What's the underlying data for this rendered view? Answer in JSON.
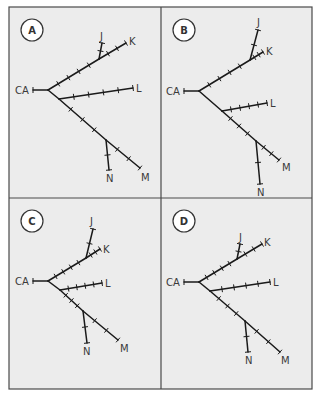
{
  "figure": {
    "outer": {
      "x": 9,
      "y": 7,
      "width": 303,
      "height": 382
    },
    "divider": {
      "x": 161,
      "y": 198
    },
    "colors": {
      "panel_bg": "#ececec",
      "frame": "#4a4a4a",
      "line": "#1a1a1a",
      "label": "#3a3a3a"
    }
  },
  "panels": [
    {
      "label": "A",
      "origin": [
        9,
        7
      ],
      "badge": [
        23,
        23
      ],
      "nodes": {
        "CA": [
          24,
          83
        ],
        "root": [
          39,
          83
        ],
        "jk": [
          90,
          52
        ],
        "J": [
          93,
          36
        ],
        "K": [
          117,
          36
        ],
        "lb": [
          50,
          92
        ],
        "L": [
          124,
          81
        ],
        "mn": [
          97,
          133
        ],
        "N": [
          100,
          163
        ],
        "M": [
          131,
          161
        ]
      },
      "tip_labels": [
        {
          "text": "CA",
          "x": 6,
          "y": 87
        },
        {
          "text": "J",
          "x": 91,
          "y": 33
        },
        {
          "text": "K",
          "x": 120,
          "y": 38
        },
        {
          "text": "L",
          "x": 127,
          "y": 85
        },
        {
          "text": "N",
          "x": 97,
          "y": 175
        },
        {
          "text": "M",
          "x": 132,
          "y": 174
        }
      ]
    },
    {
      "label": "B",
      "origin": [
        161,
        7
      ],
      "badge": [
        23,
        23
      ],
      "nodes": {
        "CA": [
          23,
          84
        ],
        "root": [
          38,
          84
        ],
        "jk": [
          89,
          53
        ],
        "J": [
          97,
          23
        ],
        "K": [
          102,
          45
        ],
        "lb": [
          61,
          104
        ],
        "L": [
          106,
          96
        ],
        "mn": [
          95,
          134
        ],
        "N": [
          99,
          177
        ],
        "M": [
          118,
          153
        ]
      },
      "tip_labels": [
        {
          "text": "CA",
          "x": 5,
          "y": 88
        },
        {
          "text": "J",
          "x": 96,
          "y": 19
        },
        {
          "text": "K",
          "x": 105,
          "y": 48
        },
        {
          "text": "L",
          "x": 109,
          "y": 100
        },
        {
          "text": "N",
          "x": 96,
          "y": 189
        },
        {
          "text": "M",
          "x": 121,
          "y": 164
        }
      ]
    },
    {
      "label": "C",
      "origin": [
        9,
        198
      ],
      "badge": [
        23,
        23
      ],
      "nodes": {
        "CA": [
          24,
          83
        ],
        "root": [
          39,
          83
        ],
        "jk": [
          77,
          60
        ],
        "J": [
          84,
          31
        ],
        "K": [
          91,
          51
        ],
        "lb": [
          51,
          92
        ],
        "L": [
          93,
          85
        ],
        "mn": [
          74,
          113
        ],
        "N": [
          78,
          145
        ],
        "M": [
          109,
          142
        ]
      },
      "tip_labels": [
        {
          "text": "CA",
          "x": 6,
          "y": 87
        },
        {
          "text": "J",
          "x": 81,
          "y": 27
        },
        {
          "text": "K",
          "x": 94,
          "y": 55
        },
        {
          "text": "L",
          "x": 96,
          "y": 89
        },
        {
          "text": "N",
          "x": 74,
          "y": 157
        },
        {
          "text": "M",
          "x": 111,
          "y": 154
        }
      ]
    },
    {
      "label": "D",
      "origin": [
        161,
        198
      ],
      "badge": [
        23,
        23
      ],
      "nodes": {
        "CA": [
          23,
          84
        ],
        "root": [
          38,
          84
        ],
        "jk": [
          76,
          61
        ],
        "J": [
          79,
          46
        ],
        "K": [
          101,
          46
        ],
        "lb": [
          49,
          93
        ],
        "L": [
          109,
          84
        ],
        "mn": [
          84,
          123
        ],
        "N": [
          87,
          154
        ],
        "M": [
          119,
          154
        ]
      },
      "tip_labels": [
        {
          "text": "CA",
          "x": 5,
          "y": 88
        },
        {
          "text": "J",
          "x": 78,
          "y": 43
        },
        {
          "text": "K",
          "x": 103,
          "y": 48
        },
        {
          "text": "L",
          "x": 112,
          "y": 88
        },
        {
          "text": "N",
          "x": 84,
          "y": 166
        },
        {
          "text": "M",
          "x": 120,
          "y": 166
        }
      ]
    }
  ]
}
